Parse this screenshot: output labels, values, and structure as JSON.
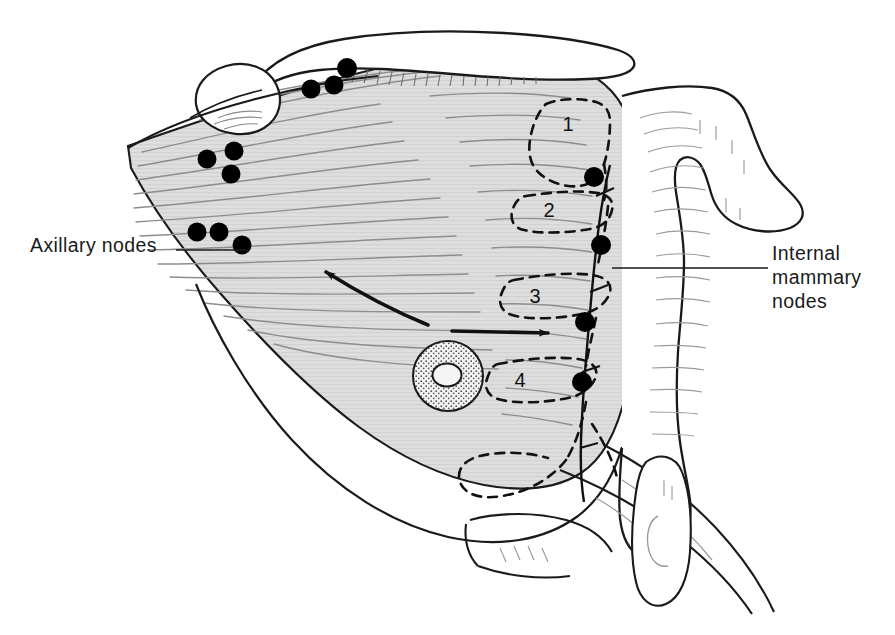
{
  "figure": {
    "background_color": "#ffffff",
    "ink_color": "#1a1a1a",
    "muscle_fill": "#dcdcdc",
    "bone_fill": "#ffffff",
    "areola_fill": "#cfcfcf",
    "node_color": "#000000"
  },
  "labels": {
    "axillary": {
      "text": "Axillary nodes",
      "x": 30,
      "y": 247
    },
    "internal_mammary": {
      "line1": "Internal",
      "line2": "mammary",
      "line3": "nodes",
      "x": 772,
      "y": 260
    }
  },
  "regions": [
    {
      "id": "1",
      "label": "1",
      "x": 568,
      "y": 131,
      "description": "level I axillary / upper pectoral region"
    },
    {
      "id": "2",
      "label": "2",
      "x": 549,
      "y": 217,
      "description": "level II region"
    },
    {
      "id": "3",
      "label": "3",
      "x": 535,
      "y": 303,
      "description": "level III region"
    },
    {
      "id": "4",
      "label": "4",
      "x": 520,
      "y": 387,
      "description": "level IV region"
    }
  ],
  "nodes": {
    "supraclavicular": [
      {
        "cx": 311,
        "cy": 89,
        "r": 9
      },
      {
        "cx": 334,
        "cy": 85,
        "r": 9
      },
      {
        "cx": 347,
        "cy": 68,
        "r": 10
      }
    ],
    "infraclavicular": [
      {
        "cx": 207,
        "cy": 159,
        "r": 9
      },
      {
        "cx": 234,
        "cy": 151,
        "r": 9
      },
      {
        "cx": 231,
        "cy": 174,
        "r": 9
      }
    ],
    "axillary": [
      {
        "cx": 197,
        "cy": 232,
        "r": 9
      },
      {
        "cx": 219,
        "cy": 232,
        "r": 9
      },
      {
        "cx": 242,
        "cy": 245,
        "r": 9
      }
    ],
    "internal_mammary": [
      {
        "cx": 594,
        "cy": 177,
        "r": 10
      },
      {
        "cx": 601,
        "cy": 245,
        "r": 10
      },
      {
        "cx": 585,
        "cy": 322,
        "r": 10
      },
      {
        "cx": 582,
        "cy": 382,
        "r": 10
      }
    ]
  },
  "arrows": [
    {
      "name": "drainage-to-axilla",
      "direction": "up-left",
      "from_x": 425,
      "from_y": 322,
      "to_x": 318,
      "to_y": 267
    },
    {
      "name": "drainage-to-internal-mammary",
      "direction": "right",
      "from_x": 450,
      "from_y": 330,
      "to_x": 556,
      "to_y": 333
    }
  ],
  "anatomy_parts": [
    "clavicle",
    "humeral-head",
    "pectoralis-major-muscle",
    "breast-contour",
    "nipple-areola",
    "sternum-manubrium",
    "costal-cartilage",
    "xiphoid-process",
    "internal-mammary-chain"
  ]
}
